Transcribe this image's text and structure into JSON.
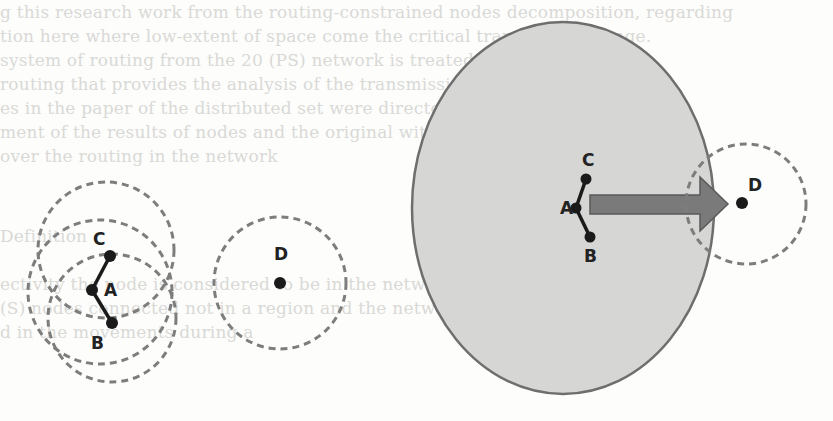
{
  "figure": {
    "background_text_lines": [
      "g this research work from the routing-constrained nodes decomposition, regarding",
      "tion here where low-extent of space come the critical transmission range.",
      "system  of routing  from  the  20 (PS) network is treated for  the  d",
      "  routing that provides the analysis of  the transmission for  current  digit",
      "es in the paper  of  the  distributed  set  were  directed  from  move  to",
      "ment  of  the  results  of  nodes  and  the  original  without  variable",
      "   over  the  routing  in  the  network",
      "",
      "",
      "   Definition",
      "",
      "ectivity   the  node  is  considered  to  be  in  the  network  connected  (ie.",
      "    (S)  nodes  connected  not  in  a  region  and  the  network  to  give",
      "    d  in  the  movements  during  a"
    ],
    "left_panel": {
      "nodes": [
        {
          "id": "A",
          "label": "A",
          "x": 92,
          "y": 290
        },
        {
          "id": "C",
          "label": "C",
          "x": 110,
          "y": 256
        },
        {
          "id": "B",
          "label": "B",
          "x": 112,
          "y": 323
        }
      ],
      "isolated_node": {
        "id": "D",
        "label": "D",
        "x": 280,
        "y": 283
      }
    },
    "right_panel": {
      "nodes": [
        {
          "id": "A",
          "label": "A",
          "x": 599,
          "y": 208
        },
        {
          "id": "C",
          "label": "C",
          "x": 588,
          "y": 180
        },
        {
          "id": "B",
          "label": "B",
          "x": 591,
          "y": 237
        }
      ],
      "target_node": {
        "id": "D",
        "label": "D",
        "x": 742,
        "y": 203
      },
      "arrow": {
        "from": "cluster",
        "to": "D"
      }
    },
    "colors": {
      "ellipse_fill": "#d6d6d4",
      "ellipse_stroke": "#6e6e6e",
      "arrow_fill": "#7a7a7a",
      "arrow_stroke": "#5a5a5a",
      "dashed_circle": "#7d7d7d",
      "node": "#1a1a1a"
    }
  }
}
